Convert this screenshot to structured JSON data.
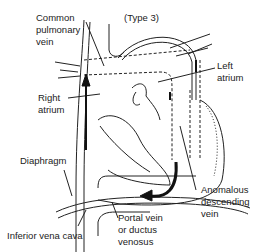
{
  "figure": {
    "subtitle": "(Type 3)",
    "labels": {
      "common_pulmonary_vein": "Common\npulmonary\nvein",
      "left_atrium": "Left\natrium",
      "right_atrium": "Right\natrium",
      "diaphragm": "Diaphragm",
      "anomalous_descending_vein": "Anomalous\ndescending\nvein",
      "portal_vein": "Portal vein\nor ductus\nvenosus",
      "inferior_vena_cava": "Inferior vena cava"
    }
  }
}
